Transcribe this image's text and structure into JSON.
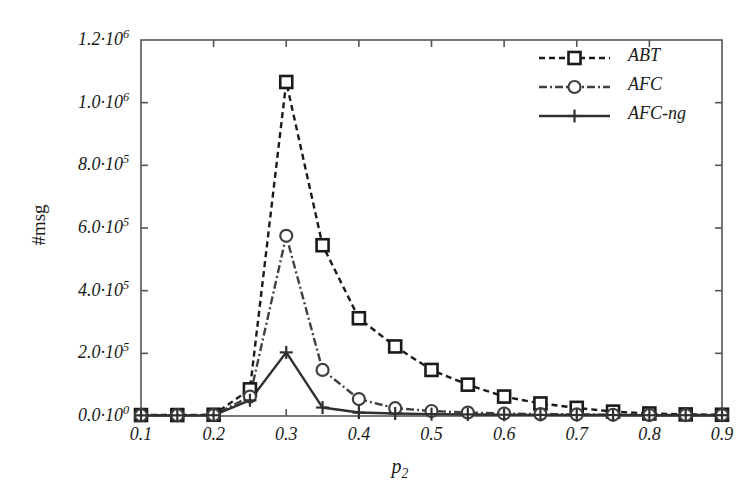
{
  "chart_data": {
    "type": "line",
    "title": "",
    "xlabel": "p2",
    "xlabel_base": "p",
    "xlabel_sub": "2",
    "ylabel": "#msg",
    "xlim": [
      0.1,
      0.9
    ],
    "ylim": [
      0,
      1200000
    ],
    "grid": false,
    "legend_position": "top-right",
    "x_tick_labels": [
      "0.1",
      "0.2",
      "0.3",
      "0.4",
      "0.5",
      "0.6",
      "0.7",
      "0.8",
      "0.9"
    ],
    "x_tick_values": [
      0.1,
      0.2,
      0.3,
      0.4,
      0.5,
      0.6,
      0.7,
      0.8,
      0.9
    ],
    "y_tick_labels": [
      {
        "mantissa": "0.0·10",
        "exponent": "0"
      },
      {
        "mantissa": "2.0·10",
        "exponent": "5"
      },
      {
        "mantissa": "4.0·10",
        "exponent": "5"
      },
      {
        "mantissa": "6.0·10",
        "exponent": "5"
      },
      {
        "mantissa": "8.0·10",
        "exponent": "5"
      },
      {
        "mantissa": "1.0·10",
        "exponent": "6"
      },
      {
        "mantissa": "1.2·10",
        "exponent": "6"
      }
    ],
    "y_tick_values": [
      0,
      200000,
      400000,
      600000,
      800000,
      1000000,
      1200000
    ],
    "x": [
      0.1,
      0.15,
      0.2,
      0.25,
      0.3,
      0.35,
      0.4,
      0.45,
      0.5,
      0.55,
      0.6,
      0.65,
      0.7,
      0.75,
      0.8,
      0.85,
      0.9
    ],
    "series": [
      {
        "name": "ABT",
        "marker": "square",
        "linestyle": "dashed",
        "color": "#1a1a1a",
        "values": [
          3000,
          3000,
          4000,
          85000,
          1066000,
          545000,
          312000,
          222000,
          147000,
          100000,
          62000,
          40000,
          26000,
          14000,
          8000,
          5000,
          4000
        ]
      },
      {
        "name": "AFC",
        "marker": "circle",
        "linestyle": "dashdot",
        "color": "#404040",
        "values": [
          2500,
          2500,
          3000,
          62000,
          575000,
          147000,
          54000,
          25000,
          16000,
          11000,
          8000,
          6000,
          5000,
          4000,
          3500,
          3000,
          3000
        ]
      },
      {
        "name": "AFC-ng",
        "marker": "plus",
        "linestyle": "solid",
        "color": "#303030",
        "values": [
          2000,
          2000,
          2500,
          50000,
          203000,
          27000,
          11000,
          8000,
          6000,
          5000,
          4000,
          3500,
          3000,
          3000,
          2500,
          2500,
          2500
        ]
      }
    ],
    "legend_entries": [
      {
        "label": "ABT",
        "marker": "square",
        "linestyle": "dashed"
      },
      {
        "label": "AFC",
        "marker": "circle",
        "linestyle": "dashdot"
      },
      {
        "label": "AFC-ng",
        "marker": "plus",
        "linestyle": "solid"
      }
    ]
  },
  "plot_geometry": {
    "left": 141,
    "right": 722,
    "top": 40,
    "bottom": 416
  }
}
